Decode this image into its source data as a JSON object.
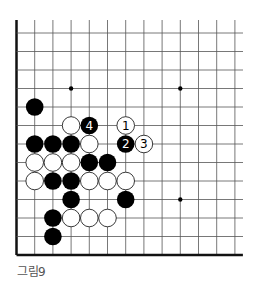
{
  "figure": {
    "caption": "그림9",
    "board": {
      "grid": {
        "origin_x": 16.5,
        "origin_y": 33,
        "dx": 18.2,
        "dy": 18.5,
        "cols": 13,
        "rows": 13,
        "top_open_y": 20,
        "right_open_x": 243,
        "left_edge": true,
        "bottom_edge": true
      },
      "colors": {
        "line": "#555555",
        "edge": "#111111",
        "black_stone": "#000000",
        "white_stone": "#ffffff",
        "white_stone_border": "#222222",
        "hoshi": "#000000"
      },
      "star_points": [
        {
          "col": 3,
          "row": 3
        },
        {
          "col": 9,
          "row": 3
        },
        {
          "col": 9,
          "row": 9
        }
      ],
      "stones": [
        {
          "color": "black",
          "col": 1,
          "row": 4
        },
        {
          "color": "white",
          "col": 3,
          "row": 5
        },
        {
          "color": "black",
          "col": 4,
          "row": 5,
          "label": "4"
        },
        {
          "color": "white",
          "col": 6,
          "row": 5,
          "label": "1"
        },
        {
          "color": "black",
          "col": 1,
          "row": 6
        },
        {
          "color": "black",
          "col": 2,
          "row": 6
        },
        {
          "color": "black",
          "col": 3,
          "row": 6
        },
        {
          "color": "white",
          "col": 4,
          "row": 6
        },
        {
          "color": "black",
          "col": 6,
          "row": 6,
          "label": "2"
        },
        {
          "color": "white",
          "col": 7,
          "row": 6,
          "label": "3"
        },
        {
          "color": "white",
          "col": 1,
          "row": 7
        },
        {
          "color": "white",
          "col": 2,
          "row": 7
        },
        {
          "color": "white",
          "col": 3,
          "row": 7
        },
        {
          "color": "black",
          "col": 4,
          "row": 7
        },
        {
          "color": "black",
          "col": 5,
          "row": 7
        },
        {
          "color": "white",
          "col": 1,
          "row": 8
        },
        {
          "color": "black",
          "col": 2,
          "row": 8
        },
        {
          "color": "black",
          "col": 3,
          "row": 8
        },
        {
          "color": "white",
          "col": 4,
          "row": 8
        },
        {
          "color": "white",
          "col": 5,
          "row": 8
        },
        {
          "color": "white",
          "col": 6,
          "row": 8
        },
        {
          "color": "black",
          "col": 3,
          "row": 9
        },
        {
          "color": "black",
          "col": 6,
          "row": 9
        },
        {
          "color": "black",
          "col": 2,
          "row": 10
        },
        {
          "color": "white",
          "col": 3,
          "row": 10
        },
        {
          "color": "white",
          "col": 4,
          "row": 10
        },
        {
          "color": "white",
          "col": 5,
          "row": 10
        },
        {
          "color": "black",
          "col": 2,
          "row": 11
        }
      ]
    }
  }
}
